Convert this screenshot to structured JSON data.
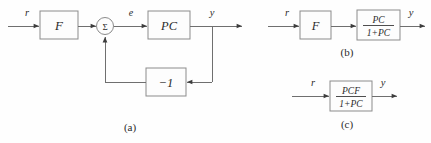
{
  "figure": {
    "background_color": "#fefefe",
    "line_color": "#6f6f6f",
    "block_stroke_color": "#8b8b8b",
    "text_color": "#2b2b2b"
  },
  "diagram_a": {
    "caption": "(a)",
    "signal_input": "r",
    "signal_error": "e",
    "signal_output": "y",
    "block_prefilter": "F",
    "block_plant_controller": "PC",
    "block_feedback_gain": "−1",
    "summing_junction": "Σ"
  },
  "diagram_b": {
    "caption": "(b)",
    "signal_input": "r",
    "signal_output": "y",
    "block_prefilter": "F",
    "block_closed_loop_numerator": "PC",
    "block_closed_loop_denominator": "1+PC"
  },
  "diagram_c": {
    "caption": "(c)",
    "signal_input": "r",
    "signal_output": "y",
    "block_total_numerator": "PCF",
    "block_total_denominator": "1+PC"
  }
}
